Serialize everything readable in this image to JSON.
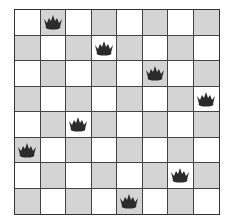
{
  "board": {
    "size": 8,
    "light_color": "#ffffff",
    "dark_color": "#d4d4d4",
    "piece_color": "#2b2b2b",
    "piece_icon": "crown-icon",
    "queens": [
      {
        "row": 0,
        "col": 1
      },
      {
        "row": 1,
        "col": 3
      },
      {
        "row": 2,
        "col": 5
      },
      {
        "row": 3,
        "col": 7
      },
      {
        "row": 4,
        "col": 2
      },
      {
        "row": 5,
        "col": 0
      },
      {
        "row": 6,
        "col": 6
      },
      {
        "row": 7,
        "col": 4
      }
    ]
  }
}
